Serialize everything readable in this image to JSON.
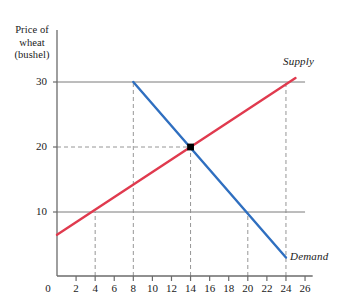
{
  "figure": {
    "background": "#ffffff",
    "axis_color": "#6b6b6b",
    "text_color": "#1a1a1a"
  },
  "axes": {
    "y_title_lines": [
      "Price of",
      "wheat",
      "(bushel)"
    ],
    "y_ticks": [
      10,
      20,
      30
    ],
    "y_tick_labels": [
      "10",
      "20",
      "30"
    ],
    "x_ticks": [
      0,
      2,
      4,
      6,
      8,
      10,
      12,
      14,
      16,
      18,
      20,
      22,
      24,
      26
    ],
    "x_tick_labels": [
      "0",
      "2",
      "4",
      "6",
      "8",
      "10",
      "12",
      "14",
      "16",
      "18",
      "20",
      "22",
      "24",
      "26"
    ],
    "origin_label": "0"
  },
  "labels": {
    "supply": "Supply",
    "demand": "Demand"
  },
  "chart_data": {
    "type": "line",
    "title": "",
    "xlabel": "",
    "ylabel": "Price of wheat (bushel)",
    "xlim": [
      0,
      27
    ],
    "ylim": [
      0,
      33
    ],
    "grid": false,
    "legend_position": "inline-at-curve-ends",
    "series": [
      {
        "name": "Supply",
        "color": "#e03a4e",
        "points": [
          [
            0,
            6.5
          ],
          [
            25,
            30.6
          ]
        ],
        "label_text": "Supply",
        "slope_direction": "upward"
      },
      {
        "name": "Demand",
        "color": "#2f6fc0",
        "points": [
          [
            8,
            30
          ],
          [
            24,
            3
          ]
        ],
        "label_text": "Demand",
        "slope_direction": "downward"
      }
    ],
    "equilibrium": {
      "quantity": 14,
      "price": 20,
      "marker": "square",
      "marker_color": "#000000"
    },
    "reference_lines": [
      {
        "name": "price-30-line",
        "type": "horizontal",
        "value": 30,
        "x_from": 0,
        "x_to": 26,
        "style": "solid",
        "color": "#6b6b6b"
      },
      {
        "name": "price-20-line",
        "type": "horizontal",
        "value": 20,
        "x_from": 0,
        "x_to": 14,
        "style": "dashed",
        "color": "#8a8a8a"
      },
      {
        "name": "price-10-line",
        "type": "horizontal",
        "value": 10,
        "x_from": 0,
        "x_to": 26,
        "style": "solid",
        "color": "#6b6b6b"
      },
      {
        "name": "quantity-4-line",
        "type": "vertical",
        "value": 4,
        "y_from": 0,
        "y_to": 10,
        "style": "dashed",
        "color": "#8a8a8a"
      },
      {
        "name": "quantity-8-line",
        "type": "vertical",
        "value": 8,
        "y_from": 0,
        "y_to": 30,
        "style": "dashed",
        "color": "#8a8a8a"
      },
      {
        "name": "quantity-14-line",
        "type": "vertical",
        "value": 14,
        "y_from": 0,
        "y_to": 20,
        "style": "dashed",
        "color": "#8a8a8a"
      },
      {
        "name": "quantity-20-line",
        "type": "vertical",
        "value": 20,
        "y_from": 0,
        "y_to": 10,
        "style": "dashed",
        "color": "#8a8a8a"
      },
      {
        "name": "quantity-24-line",
        "type": "vertical",
        "value": 24,
        "y_from": 0,
        "y_to": 30,
        "style": "dashed",
        "color": "#8a8a8a"
      }
    ]
  }
}
